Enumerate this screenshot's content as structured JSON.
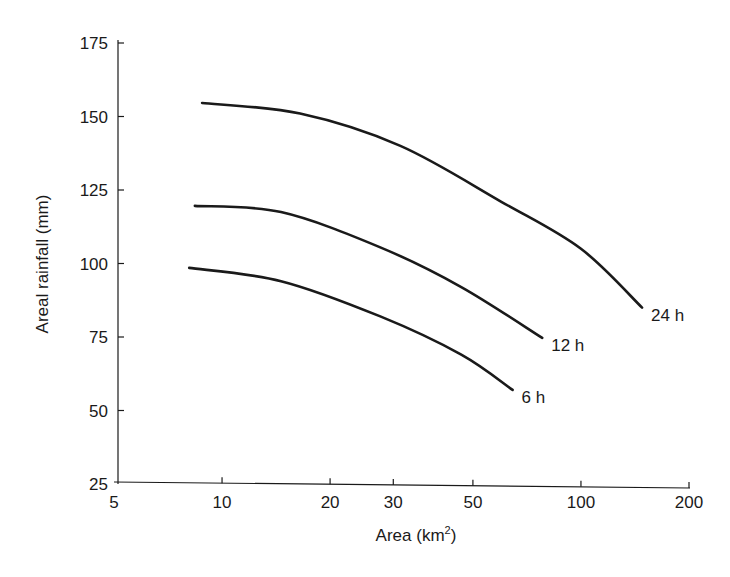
{
  "chart_data": {
    "type": "line",
    "title": "",
    "xlabel": "Area (km²)",
    "xlabel_base": "Area (km",
    "xlabel_sup": "2",
    "xlabel_close": ")",
    "ylabel": "Areal rainfall (mm)",
    "xscale": "log",
    "xlim": [
      5,
      200
    ],
    "ylim": [
      25,
      175
    ],
    "x_ticks": [
      5,
      10,
      20,
      30,
      50,
      100,
      200
    ],
    "x_tick_labels": [
      "5",
      "10",
      "20",
      "30",
      "50",
      "100",
      "200"
    ],
    "y_ticks": [
      25,
      50,
      75,
      100,
      125,
      150,
      175
    ],
    "y_tick_labels": [
      "25",
      "50",
      "75",
      "100",
      "125",
      "150",
      "175"
    ],
    "grid": false,
    "legend": "inline labels at curve ends",
    "series": [
      {
        "name": "24h",
        "label": "24 h",
        "x": [
          8.8,
          16.5,
          31.4,
          60,
          100,
          148
        ],
        "values": [
          154.6,
          151,
          140,
          121,
          105,
          85
        ]
      },
      {
        "name": "12h",
        "label": "12 h",
        "x": [
          8.4,
          14.6,
          27.6,
          46.4,
          78
        ],
        "values": [
          119.6,
          117.5,
          105.5,
          92,
          74.7
        ]
      },
      {
        "name": "6h",
        "label": "6 h",
        "x": [
          8.1,
          14.6,
          27.6,
          46.4,
          64.5
        ],
        "values": [
          98.5,
          94,
          82,
          69,
          57
        ]
      }
    ],
    "line_color": "#1a1a1a"
  }
}
